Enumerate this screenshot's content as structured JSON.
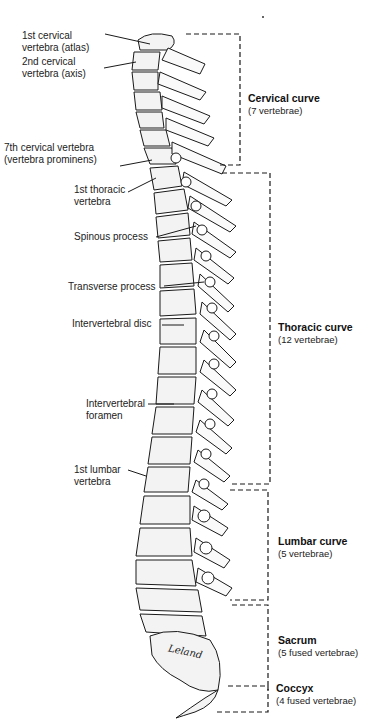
{
  "diagram": {
    "signature": "Leland",
    "left_labels": [
      {
        "id": "atlas",
        "lines": [
          "1st cervical",
          "vertebra (atlas)"
        ],
        "x": 22,
        "y": 30
      },
      {
        "id": "axis",
        "lines": [
          "2nd cervical",
          "vertebra (axis)"
        ],
        "x": 22,
        "y": 56
      },
      {
        "id": "c7",
        "lines": [
          "7th cervical vertebra",
          "(vertebra prominens)"
        ],
        "x": 4,
        "y": 142
      },
      {
        "id": "t1",
        "lines": [
          "1st thoracic",
          "vertebra"
        ],
        "x": 74,
        "y": 184
      },
      {
        "id": "spinous",
        "lines": [
          "Spinous process"
        ],
        "x": 74,
        "y": 231
      },
      {
        "id": "transverse",
        "lines": [
          "Transverse process"
        ],
        "x": 68,
        "y": 281
      },
      {
        "id": "disc",
        "lines": [
          "Intervertebral disc"
        ],
        "x": 72,
        "y": 318
      },
      {
        "id": "foramen",
        "lines": [
          "Intervertebral",
          "foramen"
        ],
        "x": 86,
        "y": 398
      },
      {
        "id": "l1",
        "lines": [
          "1st lumbar",
          "vertebra"
        ],
        "x": 74,
        "y": 464
      }
    ],
    "regions": [
      {
        "id": "cervical",
        "title": "Cervical curve",
        "sub": "(7 vertebrae)",
        "x": 248,
        "y": 92
      },
      {
        "id": "thoracic",
        "title": "Thoracic curve",
        "sub": "(12 vertebrae)",
        "x": 278,
        "y": 321
      },
      {
        "id": "lumbar",
        "title": "Lumbar curve",
        "sub": "(5 vertebrae)",
        "x": 278,
        "y": 535
      },
      {
        "id": "sacrum",
        "title": "Sacrum",
        "sub": "(5 fused vertebrae)",
        "x": 278,
        "y": 634
      },
      {
        "id": "coccyx",
        "title": "Coccyx",
        "sub": "(4 fused vertebrae)",
        "x": 276,
        "y": 682
      }
    ],
    "colors": {
      "ink": "#1a1a1a",
      "bone": "#f2f2f2",
      "background": "#ffffff"
    }
  }
}
